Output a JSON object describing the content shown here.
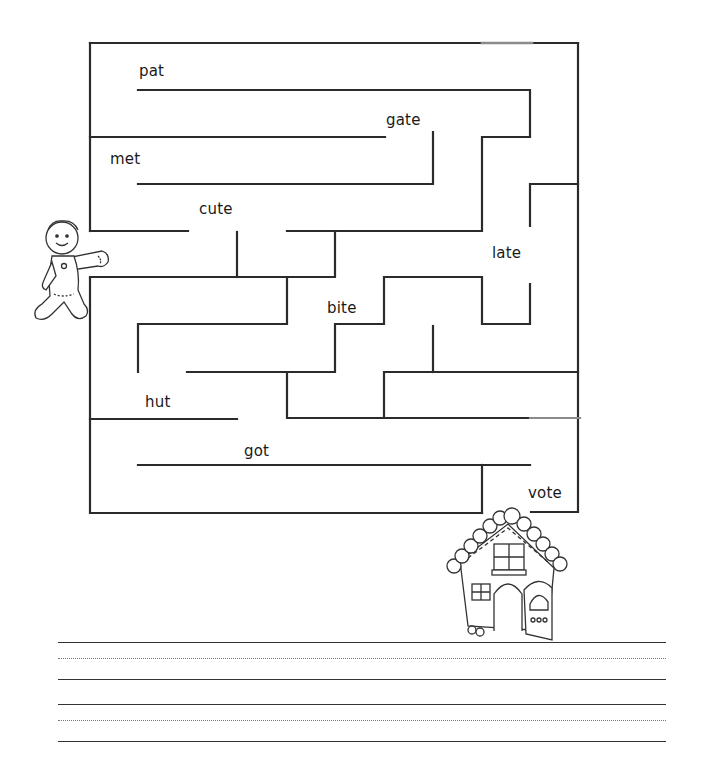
{
  "worksheet": {
    "title": "Gingerbread maze",
    "words": [
      {
        "text": "pat",
        "x": 139,
        "y": 62
      },
      {
        "text": "gate",
        "x": 386,
        "y": 111
      },
      {
        "text": "met",
        "x": 110,
        "y": 150
      },
      {
        "text": "cute",
        "x": 199,
        "y": 200
      },
      {
        "text": "late",
        "x": 492,
        "y": 244
      },
      {
        "text": "bite",
        "x": 327,
        "y": 299
      },
      {
        "text": "hut",
        "x": 145,
        "y": 393
      },
      {
        "text": "got",
        "x": 244,
        "y": 442
      },
      {
        "text": "vote",
        "x": 528,
        "y": 484
      }
    ],
    "start_character": "gingerbread-man",
    "finish_image": "gingerbread-house",
    "writing_lines": [
      {
        "type": "solid",
        "y": 642
      },
      {
        "type": "dotted",
        "y": 658
      },
      {
        "type": "solid",
        "y": 679
      },
      {
        "type": "solid",
        "y": 704
      },
      {
        "type": "dotted",
        "y": 720
      },
      {
        "type": "solid",
        "y": 741
      }
    ]
  },
  "colors": {
    "ink": "#2b2b2b",
    "paper": "#ffffff",
    "faint_line": "#888888"
  }
}
